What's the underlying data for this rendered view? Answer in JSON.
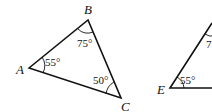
{
  "triangle1": {
    "vertices": {
      "A": "A",
      "B": "B",
      "C": "C"
    },
    "angles": {
      "A": "55°",
      "B": "75°",
      "C": "50°"
    }
  },
  "triangle2": {
    "vertices": {
      "E": "E"
    },
    "angles": {
      "E": "55°",
      "top_partial": "7"
    }
  }
}
